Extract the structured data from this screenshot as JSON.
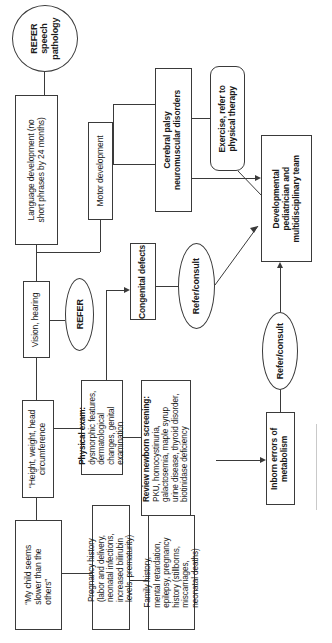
{
  "document": {
    "kind": "clinical-algorithm-flowchart",
    "orientation": "rotated-90-counterclockwise",
    "title": "Developmental delay evaluation flowchart"
  },
  "nodes": {
    "refer_speech_pathology": {
      "label": "REFER\nspeech\npathology",
      "lines": [
        "REFER",
        "speech",
        "pathology"
      ],
      "shape": "circle",
      "bold": true
    },
    "language_development": {
      "label": "Language development (no short phrases by 24 months)",
      "lines": [
        "Language development (no",
        "short phrases by 24 months)"
      ],
      "shape": "rect",
      "bold": false
    },
    "motor_development": {
      "label": "Motor development",
      "lines": [
        "Motor development"
      ],
      "shape": "rect",
      "bold": false
    },
    "cerebral_palsy": {
      "label": "Cerebral palsy neuromuscular disorders",
      "lines": [
        "Cerebral palsy",
        "neuromuscular disorders"
      ],
      "shape": "rect",
      "bold": true
    },
    "exercise_physical_therapy": {
      "label": "Exercise, refer to physical therapy",
      "lines": [
        "Exercise, refer to",
        "physical therapy"
      ],
      "shape": "rounded-rect",
      "bold": true
    },
    "developmental_pediatrician": {
      "label": "Developmental pediatrician and multidisciplinary team",
      "lines": [
        "Developmental",
        "pediatrician and",
        "multidisciplinary team"
      ],
      "shape": "rect",
      "bold": true
    },
    "vision_hearing": {
      "label": "Vision, hearing",
      "lines": [
        "Vision, hearing"
      ],
      "shape": "rect",
      "bold": false
    },
    "refer": {
      "label": "REFER",
      "lines": [
        "REFER"
      ],
      "shape": "ellipse",
      "bold": true
    },
    "congenital_defects": {
      "label": "Congenital defects",
      "lines": [
        "Congenital defects"
      ],
      "shape": "rect",
      "bold": true
    },
    "refer_consult_top": {
      "label": "Refer/consult",
      "lines": [
        "Refer/consult"
      ],
      "shape": "ellipse",
      "bold": true
    },
    "height_weight_head": {
      "label": "“Height, weight, head circumference",
      "lines": [
        "“Height, weight, head",
        "circumference"
      ],
      "shape": "rect",
      "bold": false
    },
    "physical_exam": {
      "label": "Physical exam: dysmorphic features, dermatological changes, genital examination",
      "heading": "Physical exam:",
      "lines": [
        "dysmorphic features,",
        "dermatological",
        "changes, genital",
        "examination"
      ],
      "shape": "rect",
      "bold": false
    },
    "review_newborn_screening": {
      "label": "Review newborn screening: PKU, homocystinuria, galactosemia, maple syrup urine disease, thyroid disorder, biotinidase deficiency",
      "heading": "Review newborn screening:",
      "lines": [
        "PKU, homocystinuria,",
        "galactosemia, maple syrup",
        "urine disease, thyroid disorder,",
        "biotinidase deficiency"
      ],
      "shape": "rect",
      "bold": false
    },
    "inborn_errors": {
      "label": "Inborn errors of metabolism",
      "lines": [
        "Inborn errors of",
        "metabolism"
      ],
      "shape": "rect",
      "bold": true
    },
    "refer_consult_bottom": {
      "label": "Refer/consult",
      "lines": [
        "Refer/consult"
      ],
      "shape": "ellipse",
      "bold": true
    },
    "my_child_slower": {
      "label": "“My child seems slower than the others”",
      "lines": [
        "“My child seems",
        "slower than the",
        "others”"
      ],
      "shape": "rect",
      "bold": false
    },
    "pregnancy_history": {
      "label": "Pregnancy history (labor and delivery, neonatal infections, increased bilirubin levels, prematurity)",
      "lines": [
        "Pregnancy history",
        "(labor and delivery,",
        "neonatal infections,",
        "increased bilirubin",
        "levels, prematurity)"
      ],
      "shape": "rect",
      "bold": false
    },
    "family_history": {
      "label": "Family history, mental retardation, epilepsy, pregnancy history (stillborns, miscarriages, neonatal deaths)",
      "lines": [
        "Family history,",
        "mental retardation,",
        "epilepsy, pregnancy",
        "history (stillborns,",
        "miscarriages,",
        "neonatal deaths)"
      ],
      "shape": "rect",
      "bold": false
    }
  },
  "colors": {
    "stroke": "#3a3a3a",
    "background": "#ffffff",
    "text": "#1a1a1a"
  }
}
